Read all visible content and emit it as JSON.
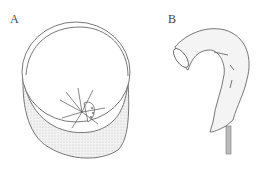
{
  "panels": [
    {
      "label": "A",
      "description": "Circular dish containing a spiky hemispherical object"
    },
    {
      "label": "B",
      "description": "Hook-shaped hollow tube on a stem"
    }
  ],
  "colors": {
    "stroke": "#555555",
    "fill_shade": "#e6e6e6",
    "background": "#ffffff"
  }
}
